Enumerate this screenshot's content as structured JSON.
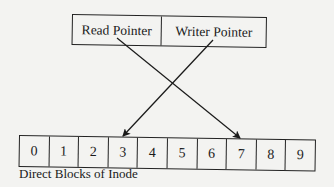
{
  "pointers": {
    "read_label": "Read Pointer",
    "write_label": "Writer Pointer"
  },
  "blocks": {
    "cells": [
      "0",
      "1",
      "2",
      "3",
      "4",
      "5",
      "6",
      "7",
      "8",
      "9"
    ],
    "caption": "Direct Blocks of Inode"
  },
  "arrows": [
    {
      "from": "Read Pointer",
      "to_block": "7"
    },
    {
      "from": "Writer Pointer",
      "to_block": "3"
    }
  ],
  "colors": {
    "background": "#f3f3f1",
    "ink": "#1a1a1a"
  }
}
